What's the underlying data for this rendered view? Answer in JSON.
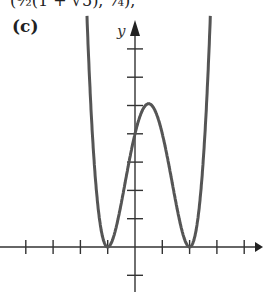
{
  "fragment": {
    "top_text": "(½(1 + √5), ¼),"
  },
  "figure": {
    "label": "(c)",
    "y_axis_label": "y"
  },
  "chart_data": {
    "type": "line",
    "title": "",
    "function": "y = (x+1)^2 (x-2)^2",
    "xlabel": "x",
    "ylabel": "y",
    "xlim": [
      -5,
      4.7
    ],
    "ylim": [
      -1.5,
      8
    ],
    "x_ticks": [
      -4,
      -3,
      -2,
      -1,
      1,
      2,
      3,
      4
    ],
    "y_ticks": [
      -1,
      1,
      2,
      3,
      4,
      5,
      6,
      7
    ],
    "grid": false,
    "key_points": [
      {
        "x": -1,
        "y": 0,
        "kind": "minimum"
      },
      {
        "x": 0.5,
        "y": 5.0625,
        "kind": "local maximum"
      },
      {
        "x": 2,
        "y": 0,
        "kind": "minimum"
      },
      {
        "x": 0,
        "y": 4,
        "kind": "y-intercept"
      }
    ],
    "color": "#555555"
  }
}
